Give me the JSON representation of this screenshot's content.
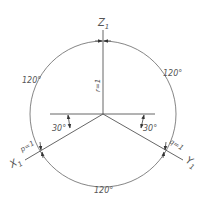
{
  "diagram": {
    "axes": {
      "z": {
        "label": "Z",
        "subscript": "1",
        "coef_label": "r=1"
      },
      "x": {
        "label": "X",
        "subscript": "1",
        "coef_label": "p=1"
      },
      "y": {
        "label": "Y",
        "subscript": "1",
        "coef_label": "q=1"
      }
    },
    "angles": {
      "left_arc": "120°",
      "right_arc": "120°",
      "bottom_arc": "120°",
      "left_tilt": "30°",
      "right_tilt": "30°"
    },
    "colors": {
      "stroke": "#555555",
      "background": "#ffffff"
    }
  }
}
